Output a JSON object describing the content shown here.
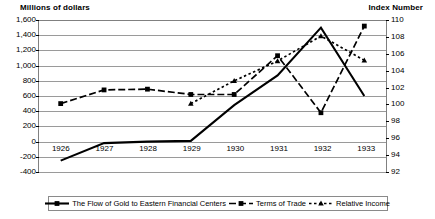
{
  "chart_data": {
    "type": "line",
    "title": "",
    "categories": [
      "1926",
      "1927",
      "1928",
      "1929",
      "1930",
      "1931",
      "1932",
      "1933"
    ],
    "left_axis": {
      "label": "Millions of dollars",
      "ticks": [
        "1,600",
        "1,400",
        "1,200",
        "1,000",
        "800",
        "600",
        "400",
        "200",
        "0",
        "-200",
        "-400"
      ],
      "tick_values": [
        1600,
        1400,
        1200,
        1000,
        800,
        600,
        400,
        200,
        0,
        -200,
        -400
      ],
      "ylim": [
        -400,
        1600
      ]
    },
    "right_axis": {
      "label": "Index Number",
      "ticks": [
        "110",
        "108",
        "106",
        "104",
        "102",
        "100",
        "98",
        "96",
        "94",
        "92"
      ],
      "tick_values": [
        110,
        108,
        106,
        104,
        102,
        100,
        98,
        96,
        94,
        92
      ],
      "ylim": [
        92,
        110
      ]
    },
    "grid": true,
    "legend_position": "bottom",
    "series": [
      {
        "name": "The Flow of Gold to Eastern Financial Centers",
        "axis": "left",
        "style": "solid",
        "marker": "none",
        "color": "#000000",
        "values": [
          -250,
          -20,
          0,
          10,
          480,
          870,
          1500,
          600
        ]
      },
      {
        "name": "Terms of Trade",
        "axis": "left",
        "style": "dashed",
        "marker": "square",
        "color": "#000000",
        "values": [
          500,
          680,
          690,
          620,
          620,
          1130,
          380,
          1520
        ]
      },
      {
        "name": "Relative Income",
        "axis": "left",
        "style": "dotted",
        "marker": "triangle",
        "color": "#000000",
        "values": [
          null,
          null,
          null,
          500,
          800,
          1060,
          1390,
          1070
        ]
      }
    ]
  },
  "legend": {
    "entries": [
      {
        "label": "The Flow of Gold to Eastern Financial Centers",
        "style": "solid"
      },
      {
        "label": "Terms of Trade",
        "style": "dashed"
      },
      {
        "label": "Relative Income",
        "style": "dotted"
      }
    ]
  }
}
